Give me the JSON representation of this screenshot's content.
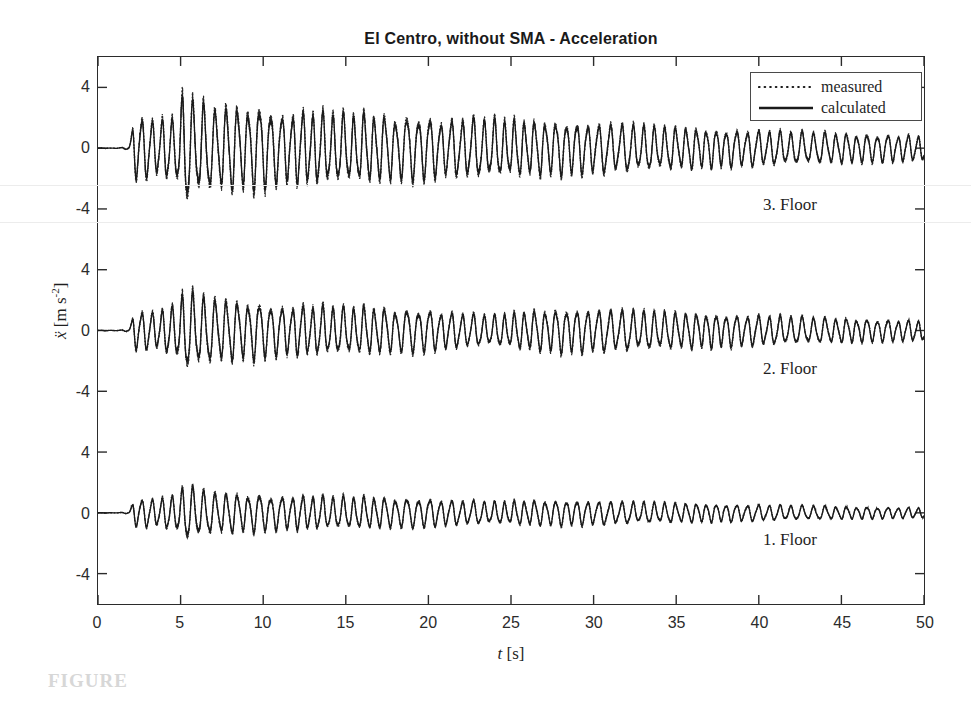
{
  "chart_data": {
    "type": "line",
    "title": "El Centro, without SMA - Acceleration",
    "xlabel": "t [s]",
    "ylabel": "ÿ [m s⁻²]",
    "xlabel_var": "t",
    "xlabel_unit": "[s]",
    "ylabel_var": "ẍ",
    "ylabel_unit": "[m s",
    "ylabel_exp": "-2",
    "ylabel_unit_close": "]",
    "xlim": [
      0,
      50
    ],
    "xticks": [
      0,
      5,
      10,
      15,
      20,
      25,
      30,
      35,
      40,
      45,
      50
    ],
    "xtick_labels": [
      "0",
      "5",
      "10",
      "15",
      "20",
      "25",
      "30",
      "35",
      "40",
      "45",
      "50"
    ],
    "grid": false,
    "legend_position": "top-right",
    "series": [
      {
        "name": "measured",
        "style": "dotted",
        "color": "#1a1a1a"
      },
      {
        "name": "calculated",
        "style": "solid",
        "color": "#1a1a1a"
      }
    ],
    "panels": [
      {
        "label": "3. Floor",
        "ylim": [
          -6,
          6
        ],
        "yticks": [
          4,
          0,
          -4
        ],
        "ytick_labels": [
          "4",
          "0",
          "-4"
        ],
        "peak_amplitude": 3.4,
        "quiet_until_s": 1.8,
        "peak_time_s": 5.3,
        "envelope": [
          {
            "t": 0.0,
            "a": 0.08
          },
          {
            "t": 1.0,
            "a": 0.15
          },
          {
            "t": 1.8,
            "a": 0.45
          },
          {
            "t": 2.2,
            "a": 1.95
          },
          {
            "t": 2.8,
            "a": 1.75
          },
          {
            "t": 3.4,
            "a": 1.55
          },
          {
            "t": 4.0,
            "a": 1.8
          },
          {
            "t": 4.6,
            "a": 1.6
          },
          {
            "t": 5.2,
            "a": 3.35
          },
          {
            "t": 5.8,
            "a": 2.55
          },
          {
            "t": 6.4,
            "a": 2.7
          },
          {
            "t": 7.0,
            "a": 2.1
          },
          {
            "t": 7.8,
            "a": 2.55
          },
          {
            "t": 8.6,
            "a": 2.25
          },
          {
            "t": 9.4,
            "a": 2.35
          },
          {
            "t": 10.2,
            "a": 2.4
          },
          {
            "t": 11.0,
            "a": 1.85
          },
          {
            "t": 12.0,
            "a": 2.1
          },
          {
            "t": 13.0,
            "a": 2.05
          },
          {
            "t": 14.0,
            "a": 2.0
          },
          {
            "t": 15.0,
            "a": 1.9
          },
          {
            "t": 16.5,
            "a": 1.95
          },
          {
            "t": 18.0,
            "a": 1.75
          },
          {
            "t": 19.5,
            "a": 1.85
          },
          {
            "t": 21.0,
            "a": 1.55
          },
          {
            "t": 22.5,
            "a": 1.7
          },
          {
            "t": 24.0,
            "a": 1.6
          },
          {
            "t": 26.0,
            "a": 1.55
          },
          {
            "t": 28.0,
            "a": 1.5
          },
          {
            "t": 30.0,
            "a": 1.4
          },
          {
            "t": 32.0,
            "a": 1.35
          },
          {
            "t": 34.0,
            "a": 1.2
          },
          {
            "t": 36.0,
            "a": 1.15
          },
          {
            "t": 38.0,
            "a": 1.05
          },
          {
            "t": 40.0,
            "a": 1.0
          },
          {
            "t": 42.0,
            "a": 0.92
          },
          {
            "t": 44.0,
            "a": 0.88
          },
          {
            "t": 46.0,
            "a": 0.82
          },
          {
            "t": 48.0,
            "a": 0.78
          },
          {
            "t": 50.0,
            "a": 0.72
          }
        ]
      },
      {
        "label": "2. Floor",
        "ylim": [
          -6,
          6
        ],
        "yticks": [
          4,
          0,
          -4
        ],
        "ytick_labels": [
          "4",
          "0",
          "-4"
        ],
        "peak_amplitude": 2.3,
        "quiet_until_s": 1.8,
        "peak_time_s": 5.5,
        "envelope": [
          {
            "t": 0.0,
            "a": 0.06
          },
          {
            "t": 1.0,
            "a": 0.12
          },
          {
            "t": 1.8,
            "a": 0.35
          },
          {
            "t": 2.2,
            "a": 1.2
          },
          {
            "t": 2.8,
            "a": 1.1
          },
          {
            "t": 3.4,
            "a": 1.05
          },
          {
            "t": 4.0,
            "a": 1.25
          },
          {
            "t": 4.6,
            "a": 1.4
          },
          {
            "t": 5.2,
            "a": 2.2
          },
          {
            "t": 5.8,
            "a": 2.1
          },
          {
            "t": 6.4,
            "a": 1.95
          },
          {
            "t": 7.0,
            "a": 1.7
          },
          {
            "t": 7.8,
            "a": 1.8
          },
          {
            "t": 8.6,
            "a": 1.6
          },
          {
            "t": 9.4,
            "a": 1.65
          },
          {
            "t": 10.2,
            "a": 1.55
          },
          {
            "t": 11.0,
            "a": 1.35
          },
          {
            "t": 12.0,
            "a": 1.45
          },
          {
            "t": 13.0,
            "a": 1.4
          },
          {
            "t": 14.0,
            "a": 1.35
          },
          {
            "t": 15.0,
            "a": 1.3
          },
          {
            "t": 16.5,
            "a": 1.35
          },
          {
            "t": 18.0,
            "a": 1.2
          },
          {
            "t": 19.5,
            "a": 1.25
          },
          {
            "t": 21.0,
            "a": 1.05
          },
          {
            "t": 22.5,
            "a": 0.95
          },
          {
            "t": 24.0,
            "a": 0.85
          },
          {
            "t": 26.0,
            "a": 1.1
          },
          {
            "t": 28.0,
            "a": 1.25
          },
          {
            "t": 30.0,
            "a": 1.2
          },
          {
            "t": 32.0,
            "a": 1.15
          },
          {
            "t": 34.0,
            "a": 1.05
          },
          {
            "t": 36.0,
            "a": 1.0
          },
          {
            "t": 38.0,
            "a": 0.92
          },
          {
            "t": 40.0,
            "a": 0.85
          },
          {
            "t": 42.0,
            "a": 0.78
          },
          {
            "t": 44.0,
            "a": 0.72
          },
          {
            "t": 46.0,
            "a": 0.68
          },
          {
            "t": 48.0,
            "a": 0.62
          },
          {
            "t": 50.0,
            "a": 0.58
          }
        ]
      },
      {
        "label": "1. Floor",
        "ylim": [
          -6,
          6
        ],
        "yticks": [
          4,
          0,
          -4
        ],
        "ytick_labels": [
          "4",
          "0",
          "-4"
        ],
        "peak_amplitude": 1.6,
        "quiet_until_s": 1.8,
        "peak_time_s": 5.6,
        "envelope": [
          {
            "t": 0.0,
            "a": 0.05
          },
          {
            "t": 1.0,
            "a": 0.1
          },
          {
            "t": 1.8,
            "a": 0.28
          },
          {
            "t": 2.2,
            "a": 0.85
          },
          {
            "t": 2.8,
            "a": 0.8
          },
          {
            "t": 3.4,
            "a": 0.78
          },
          {
            "t": 4.0,
            "a": 0.9
          },
          {
            "t": 4.6,
            "a": 0.95
          },
          {
            "t": 5.2,
            "a": 1.5
          },
          {
            "t": 5.8,
            "a": 1.45
          },
          {
            "t": 6.4,
            "a": 1.3
          },
          {
            "t": 7.0,
            "a": 1.1
          },
          {
            "t": 7.8,
            "a": 1.2
          },
          {
            "t": 8.6,
            "a": 1.05
          },
          {
            "t": 9.4,
            "a": 1.1
          },
          {
            "t": 10.2,
            "a": 1.05
          },
          {
            "t": 11.0,
            "a": 0.92
          },
          {
            "t": 12.0,
            "a": 0.98
          },
          {
            "t": 13.0,
            "a": 0.95
          },
          {
            "t": 14.0,
            "a": 0.92
          },
          {
            "t": 15.0,
            "a": 0.88
          },
          {
            "t": 16.5,
            "a": 0.9
          },
          {
            "t": 18.0,
            "a": 0.82
          },
          {
            "t": 19.5,
            "a": 0.85
          },
          {
            "t": 21.0,
            "a": 0.72
          },
          {
            "t": 22.5,
            "a": 0.68
          },
          {
            "t": 24.0,
            "a": 0.62
          },
          {
            "t": 26.0,
            "a": 0.7
          },
          {
            "t": 28.0,
            "a": 0.72
          },
          {
            "t": 30.0,
            "a": 0.68
          },
          {
            "t": 32.0,
            "a": 0.62
          },
          {
            "t": 34.0,
            "a": 0.58
          },
          {
            "t": 36.0,
            "a": 0.54
          },
          {
            "t": 38.0,
            "a": 0.5
          },
          {
            "t": 40.0,
            "a": 0.46
          },
          {
            "t": 42.0,
            "a": 0.42
          },
          {
            "t": 44.0,
            "a": 0.38
          },
          {
            "t": 46.0,
            "a": 0.35
          },
          {
            "t": 48.0,
            "a": 0.32
          },
          {
            "t": 50.0,
            "a": 0.3
          }
        ]
      }
    ],
    "oscillation_frequency_hz": 1.55
  },
  "caption": {
    "text": "FIGURE"
  }
}
